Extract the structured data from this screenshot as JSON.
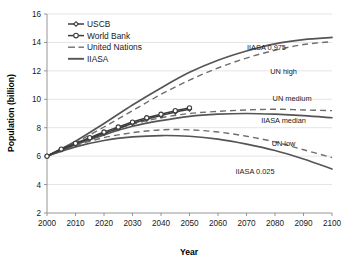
{
  "chart_data": {
    "type": "line",
    "title": "",
    "xlabel": "Year",
    "ylabel": "Population (billion)",
    "xlim": [
      2000,
      2100
    ],
    "ylim": [
      2,
      16
    ],
    "xticks": [
      2000,
      2010,
      2020,
      2030,
      2040,
      2050,
      2060,
      2070,
      2080,
      2090,
      2100
    ],
    "yticks": [
      2,
      4,
      6,
      8,
      10,
      12,
      14,
      16
    ],
    "grid": "horizontal",
    "legend_position": "top-left-inside",
    "legend": [
      {
        "label": "USCB",
        "style": "line-with-diamond-markers"
      },
      {
        "label": "World Bank",
        "style": "line-with-circle-markers"
      },
      {
        "label": "United Nations",
        "style": "dashed-line"
      },
      {
        "label": "IIASA",
        "style": "solid-line"
      }
    ],
    "annotations": [
      {
        "text": "IIASA 0.975",
        "x": 2077,
        "y": 13.45
      },
      {
        "text": "UN high",
        "x": 2083,
        "y": 11.75
      },
      {
        "text": "UN medium",
        "x": 2086,
        "y": 9.85
      },
      {
        "text": "IIASA median",
        "x": 2083,
        "y": 8.35
      },
      {
        "text": "UN low",
        "x": 2083,
        "y": 6.7
      },
      {
        "text": "IIASA 0.025",
        "x": 2073,
        "y": 4.75
      }
    ],
    "x": [
      2000,
      2010,
      2020,
      2030,
      2040,
      2050,
      2060,
      2070,
      2080,
      2090,
      2100
    ],
    "series": [
      {
        "name": "IIASA 0.975",
        "style": "solid",
        "values": [
          6.0,
          7.05,
          8.3,
          9.6,
          10.8,
          11.9,
          12.75,
          13.4,
          13.9,
          14.2,
          14.35
        ]
      },
      {
        "name": "UN high",
        "style": "dashed",
        "values": [
          6.0,
          6.95,
          8.05,
          9.2,
          10.35,
          11.35,
          12.2,
          12.9,
          13.45,
          13.85,
          14.05
        ]
      },
      {
        "name": "UN medium",
        "style": "dashed",
        "values": [
          6.0,
          6.85,
          7.6,
          8.25,
          8.7,
          9.0,
          9.15,
          9.25,
          9.3,
          9.25,
          9.2
        ]
      },
      {
        "name": "IIASA median",
        "style": "solid",
        "values": [
          6.0,
          6.8,
          7.5,
          8.1,
          8.5,
          8.8,
          8.95,
          9.0,
          8.95,
          8.85,
          8.7
        ]
      },
      {
        "name": "UN low",
        "style": "dashed",
        "values": [
          6.0,
          6.75,
          7.3,
          7.65,
          7.85,
          7.85,
          7.7,
          7.4,
          7.0,
          6.45,
          5.9
        ]
      },
      {
        "name": "IIASA 0.025",
        "style": "solid",
        "values": [
          6.0,
          6.65,
          7.1,
          7.35,
          7.45,
          7.4,
          7.2,
          6.85,
          6.4,
          5.8,
          5.1
        ]
      },
      {
        "name": "USCB",
        "style": "marked-diamond",
        "x": [
          2000,
          2005,
          2010,
          2015,
          2020,
          2025,
          2030,
          2035,
          2040,
          2045,
          2050
        ],
        "values": [
          6.0,
          6.45,
          6.85,
          7.25,
          7.6,
          7.95,
          8.3,
          8.6,
          8.85,
          9.1,
          9.3
        ]
      },
      {
        "name": "World Bank",
        "style": "marked-circle",
        "x": [
          2000,
          2005,
          2010,
          2015,
          2020,
          2025,
          2030,
          2035,
          2040,
          2045,
          2050
        ],
        "values": [
          6.0,
          6.5,
          6.9,
          7.3,
          7.7,
          8.05,
          8.4,
          8.7,
          8.95,
          9.2,
          9.4
        ]
      }
    ],
    "colors": {
      "iiasa_solid": "#555555",
      "un_dashed": "#6e6e6e",
      "marker_series": "#3d3d3d",
      "grid": "#d9d9d9",
      "axis": "#8a8a8a",
      "text": "#1a1a1a"
    }
  }
}
